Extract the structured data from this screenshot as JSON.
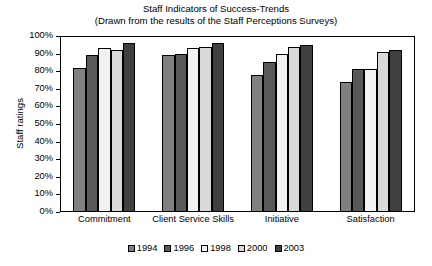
{
  "chart_data": {
    "type": "bar",
    "title": "Staff Indicators of Success-Trends",
    "subtitle": "(Drawn from the results of the Staff Perceptions Surveys)",
    "xlabel": "",
    "ylabel": "Staff ratings",
    "ylim": [
      0,
      100
    ],
    "ytick_labels": [
      "100%",
      "90%",
      "80%",
      "70%",
      "60%",
      "50%",
      "40%",
      "30%",
      "20%",
      "10%",
      "0%"
    ],
    "ytick_values": [
      100,
      90,
      80,
      70,
      60,
      50,
      40,
      30,
      20,
      10,
      0
    ],
    "grid": false,
    "legend_position": "bottom",
    "categories": [
      "Commitment",
      "Client Service Skills",
      "Initiative",
      "Satisfaction"
    ],
    "series": [
      {
        "name": "1994",
        "color": "#808080",
        "values": [
          82,
          89,
          78,
          74
        ]
      },
      {
        "name": "1996",
        "color": "#595959",
        "values": [
          89,
          89.5,
          85.5,
          81
        ]
      },
      {
        "name": "1998",
        "color": "#f2f2f2",
        "values": [
          93,
          93,
          89.5,
          81
        ]
      },
      {
        "name": "2000",
        "color": "#d9d9d9",
        "values": [
          92,
          93.5,
          93.5,
          91
        ]
      },
      {
        "name": "2003",
        "color": "#404040",
        "values": [
          96,
          96,
          95,
          92
        ]
      }
    ]
  }
}
